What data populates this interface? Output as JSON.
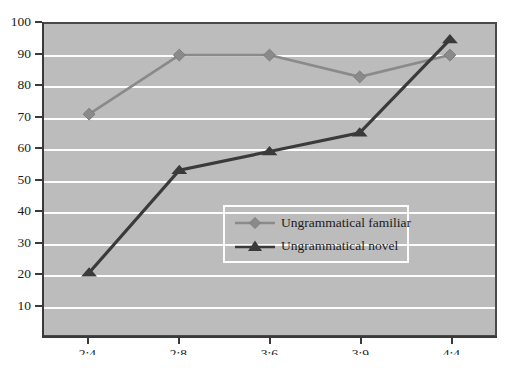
{
  "chart_data": {
    "type": "line",
    "title": "",
    "xlabel": "",
    "ylabel": "",
    "categories": [
      "2;4",
      "2;8",
      "3;6",
      "3;9",
      "4;4"
    ],
    "ylim": [
      0,
      100
    ],
    "y_ticks": [
      10,
      20,
      30,
      40,
      50,
      60,
      70,
      80,
      90,
      100
    ],
    "grid": true,
    "legend_position": "inside-center-right",
    "series": [
      {
        "name": "Ungrammatical familiar",
        "marker": "diamond",
        "color": "#8a8a8a",
        "values": [
          71,
          90,
          90,
          83,
          90
        ]
      },
      {
        "name": "Ungrammatical novel",
        "marker": "triangle",
        "color": "#3a3a3a",
        "values": [
          20,
          53,
          59,
          65,
          95
        ]
      }
    ]
  },
  "style": {
    "plot_background": "#bcbcbc",
    "gridline_color": "#fdfdfd",
    "axis_color": "#3a3a3a",
    "legend_border_color": "#fdfdfd",
    "text_color": "#1b1b1b"
  }
}
